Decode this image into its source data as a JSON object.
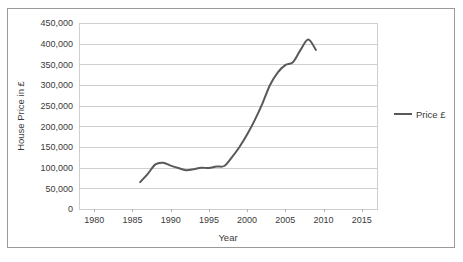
{
  "chart_data": {
    "type": "line",
    "title": "",
    "xlabel": "Year",
    "ylabel": "House Price in £",
    "xlim": [
      1978,
      2017
    ],
    "ylim": [
      0,
      450000
    ],
    "grid": true,
    "legend_position": "right",
    "x_tick_labels": [
      "1980",
      "1985",
      "1990",
      "1995",
      "2000",
      "2005",
      "2010",
      "2015"
    ],
    "x_ticks": [
      1980,
      1985,
      1990,
      1995,
      2000,
      2005,
      2010,
      2015
    ],
    "y_tick_labels": [
      "0",
      "50,000",
      "100,000",
      "150,000",
      "200,000",
      "250,000",
      "300,000",
      "350,000",
      "400,000",
      "450,000"
    ],
    "y_ticks": [
      0,
      50000,
      100000,
      150000,
      200000,
      250000,
      300000,
      350000,
      400000,
      450000
    ],
    "series": [
      {
        "name": "Price £",
        "color": "#595959",
        "x": [
          1986,
          1987,
          1988,
          1989,
          1990,
          1991,
          1992,
          1993,
          1994,
          1995,
          1996,
          1997,
          1998,
          1999,
          2000,
          2001,
          2002,
          2003,
          2004,
          2005,
          2006,
          2007,
          2008,
          2009
        ],
        "values": [
          65000,
          85000,
          108000,
          112000,
          105000,
          99000,
          94000,
          96000,
          100000,
          99000,
          103000,
          104000,
          125000,
          150000,
          180000,
          215000,
          255000,
          300000,
          330000,
          348000,
          355000,
          385000,
          410000,
          385000
        ]
      }
    ],
    "legend": [
      {
        "label": "Price £",
        "color": "#595959"
      }
    ]
  }
}
